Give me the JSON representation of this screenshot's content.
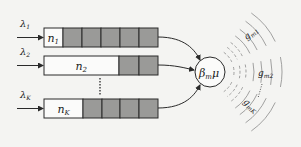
{
  "diagram": {
    "queues": [
      {
        "arrival": "λ1",
        "arrival_base": "λ",
        "arrival_sub": "1",
        "count_base": "n",
        "count_sub": "1",
        "y": 28,
        "white_end": 63,
        "grey_cells": [
          [
            63,
            82
          ],
          [
            82,
            101
          ],
          [
            101,
            120
          ],
          [
            120,
            139
          ],
          [
            139,
            158
          ]
        ]
      },
      {
        "arrival": "λ2",
        "arrival_base": "λ",
        "arrival_sub": "2",
        "count_base": "n",
        "count_sub": "2",
        "y": 56,
        "white_end": 119,
        "grey_cells": [
          [
            119,
            139
          ],
          [
            139,
            158
          ]
        ]
      },
      {
        "arrival": "λK",
        "arrival_base": "λ",
        "arrival_sub": "K",
        "count_base": "n",
        "count_sub": "K",
        "y": 99,
        "white_end": 83,
        "grey_cells": [
          [
            83,
            102
          ],
          [
            102,
            120
          ],
          [
            120,
            139
          ],
          [
            139,
            158
          ]
        ]
      }
    ],
    "server": {
      "label_base": "β",
      "label_sub": "m",
      "label_tail": "μ"
    },
    "channels": [
      {
        "base": "g",
        "sub": "m1"
      },
      {
        "base": "g",
        "sub": "m2"
      },
      {
        "base": "g",
        "sub": "mK"
      }
    ],
    "colors": {
      "cell_fill": "#9a9a98",
      "stroke": "#2a2a2a",
      "arc": "#8a8a8a",
      "background": "#f4f4f2"
    }
  }
}
